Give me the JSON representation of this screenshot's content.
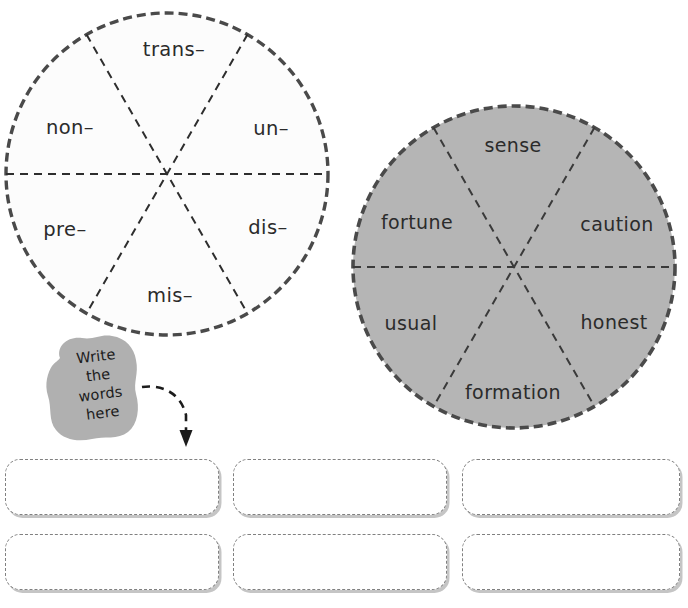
{
  "worksheet": {
    "title": "Prefix and Root Word Wheels",
    "background_color": "#ffffff"
  },
  "prefix_wheel": {
    "name": "prefix-wheel",
    "fill_color": "#fcfcfc",
    "border_color": "#4a4a4a",
    "center_x": 167,
    "center_y": 174,
    "radius": 161,
    "segments": [
      {
        "label": "trans–",
        "position": "top",
        "x": 174,
        "y": 50
      },
      {
        "label": "un–",
        "position": "upper-right",
        "x": 271,
        "y": 129
      },
      {
        "label": "dis–",
        "position": "lower-right",
        "x": 268,
        "y": 228
      },
      {
        "label": "mis–",
        "position": "bottom",
        "x": 170,
        "y": 296
      },
      {
        "label": "pre–",
        "position": "lower-left",
        "x": 65,
        "y": 230
      },
      {
        "label": "non–",
        "position": "upper-left",
        "x": 70,
        "y": 128
      }
    ]
  },
  "root_wheel": {
    "name": "root-word-wheel",
    "fill_color": "#b5b5b5",
    "border_color": "#4a4a4a",
    "center_x": 514,
    "center_y": 267,
    "radius": 161,
    "segments": [
      {
        "label": "sense",
        "position": "top",
        "x": 513,
        "y": 145
      },
      {
        "label": "caution",
        "position": "upper-right",
        "x": 617,
        "y": 224
      },
      {
        "label": "honest",
        "position": "lower-right",
        "x": 614,
        "y": 322
      },
      {
        "label": "formation",
        "position": "bottom",
        "x": 513,
        "y": 392
      },
      {
        "label": "usual",
        "position": "lower-left",
        "x": 411,
        "y": 323
      },
      {
        "label": "fortune",
        "position": "upper-left",
        "x": 417,
        "y": 222
      }
    ]
  },
  "instruction_blob": {
    "name": "write-the-words-here-blob",
    "fill_color": "#b0b0b0",
    "lines": [
      "Write",
      "the",
      "words",
      "here"
    ]
  },
  "arrow": {
    "name": "curved-dashed-arrow",
    "color": "#1c1c1c"
  },
  "answer_boxes": {
    "name": "answer-boxes",
    "border_color": "#808080",
    "fill_color": "#ffffff",
    "rows": 2,
    "columns": 3,
    "items": [
      {
        "value": "",
        "placeholder": ""
      },
      {
        "value": "",
        "placeholder": ""
      },
      {
        "value": "",
        "placeholder": ""
      },
      {
        "value": "",
        "placeholder": ""
      },
      {
        "value": "",
        "placeholder": ""
      },
      {
        "value": "",
        "placeholder": ""
      }
    ],
    "geometry": [
      {
        "x": 5,
        "y": 459,
        "w": 214,
        "h": 56
      },
      {
        "x": 233,
        "y": 459,
        "w": 214,
        "h": 56
      },
      {
        "x": 462,
        "y": 459,
        "w": 218,
        "h": 56
      },
      {
        "x": 5,
        "y": 534,
        "w": 214,
        "h": 56
      },
      {
        "x": 233,
        "y": 534,
        "w": 214,
        "h": 56
      },
      {
        "x": 462,
        "y": 534,
        "w": 218,
        "h": 56
      }
    ]
  }
}
